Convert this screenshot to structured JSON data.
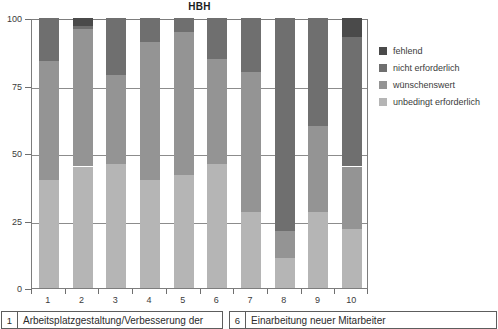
{
  "chart_data": {
    "type": "bar",
    "subtype": "stacked-100-percent",
    "title": "HBH",
    "xlabel": "",
    "ylabel": "",
    "ylim": [
      0,
      100
    ],
    "yticks": [
      0,
      25,
      50,
      75,
      100
    ],
    "ytick_labels": [
      "0",
      "25",
      "50",
      "75",
      "100"
    ],
    "grid": true,
    "grid_axis": "y",
    "legend_position": "right",
    "categories": [
      "1",
      "2",
      "3",
      "4",
      "5",
      "6",
      "7",
      "8",
      "9",
      "10"
    ],
    "series": [
      {
        "name": "unbedingt erforderlich",
        "color": "#b5b5b5",
        "values": [
          40,
          45,
          46,
          40,
          42,
          46,
          28,
          11,
          28,
          22
        ]
      },
      {
        "name": "wünschenswert",
        "color": "#949494",
        "values": [
          44,
          51,
          33,
          51,
          53,
          39,
          52,
          10,
          32,
          23
        ]
      },
      {
        "name": "nicht erforderlich",
        "color": "#6f6f6f",
        "values": [
          16,
          1,
          21,
          9,
          5,
          15,
          20,
          79,
          40,
          48
        ]
      },
      {
        "name": "fehlend",
        "color": "#4a4a4a",
        "values": [
          0,
          3,
          0,
          0,
          0,
          0,
          0,
          0,
          0,
          7
        ]
      }
    ]
  },
  "legend": {
    "items": [
      {
        "label": "fehlend",
        "color": "#4a4a4a"
      },
      {
        "label": "nicht erforderlich",
        "color": "#6f6f6f"
      },
      {
        "label": "wünschenswert",
        "color": "#949494"
      },
      {
        "label": "unbedingt erforderlich",
        "color": "#b5b5b5"
      }
    ]
  },
  "footer_table": {
    "rows": [
      {
        "number": "1",
        "text": "Arbeitsplatzgestaltung/Verbesserung der"
      },
      {
        "number": "6",
        "text": "Einarbeitung neuer Mitarbeiter"
      }
    ]
  }
}
